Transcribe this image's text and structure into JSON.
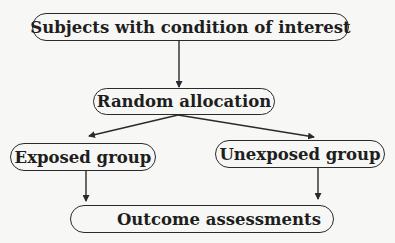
{
  "diagram": {
    "type": "flowchart",
    "nodes": [
      {
        "id": "subjects",
        "label": "Subjects with condition of interest"
      },
      {
        "id": "random",
        "label": "Random allocation"
      },
      {
        "id": "exposed",
        "label": "Exposed group"
      },
      {
        "id": "unexposed",
        "label": "Unexposed group"
      },
      {
        "id": "outcome",
        "label": "Outcome assessments"
      }
    ],
    "edges": [
      {
        "from": "subjects",
        "to": "random"
      },
      {
        "from": "random",
        "to": "exposed"
      },
      {
        "from": "random",
        "to": "unexposed"
      },
      {
        "from": "exposed",
        "to": "outcome"
      },
      {
        "from": "unexposed",
        "to": "outcome"
      }
    ],
    "colors": {
      "line": "#2a2a2a",
      "background": "#f7f7f5",
      "text": "#1e1e1e"
    }
  }
}
